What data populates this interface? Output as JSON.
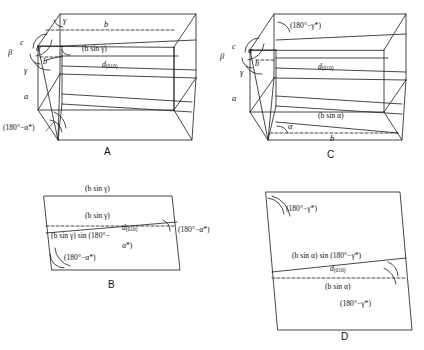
{
  "figure": {
    "background": "#ffffff",
    "line_color": "#1a1a1a",
    "panels": [
      {
        "id": "A",
        "letter": "A",
        "type": "oblique-cell-3d",
        "labels": [
          {
            "text": "γ",
            "kind": "greek-italic"
          },
          {
            "text": "c",
            "kind": "axis-italic"
          },
          {
            "text": "β",
            "kind": "greek-italic"
          },
          {
            "text": "α",
            "kind": "greek-italic"
          },
          {
            "text": "b",
            "kind": "axis-italic"
          },
          {
            "text": "γ",
            "kind": "greek-italic"
          },
          {
            "text": "a",
            "kind": "axis-italic"
          },
          {
            "text": "b",
            "kind": "edge-italic"
          },
          {
            "text": "(b sin γ)",
            "kind": "expression"
          },
          {
            "text": "d(010)",
            "kind": "d-spacing"
          },
          {
            "text": "(180°−α*)",
            "kind": "angle-expression"
          }
        ]
      },
      {
        "id": "C",
        "letter": "C",
        "type": "oblique-cell-3d",
        "labels": [
          {
            "text": "(180°−γ*)",
            "kind": "angle-expression"
          },
          {
            "text": "c",
            "kind": "axis-italic"
          },
          {
            "text": "β",
            "kind": "greek-italic"
          },
          {
            "text": "α",
            "kind": "greek-italic"
          },
          {
            "text": "b",
            "kind": "axis-italic"
          },
          {
            "text": "γ",
            "kind": "greek-italic"
          },
          {
            "text": "a",
            "kind": "axis-italic"
          },
          {
            "text": "d(010)",
            "kind": "d-spacing"
          },
          {
            "text": "(b sin α)",
            "kind": "expression"
          },
          {
            "text": "α",
            "kind": "greek-italic"
          },
          {
            "text": "b",
            "kind": "edge-italic"
          }
        ]
      },
      {
        "id": "B",
        "letter": "B",
        "type": "parallelogram-2d",
        "labels": [
          {
            "text": "(b sin γ)",
            "kind": "expression"
          },
          {
            "text": "(b sin γ)",
            "kind": "expression"
          },
          {
            "text": "(b sin γ) sin (180°−α*)",
            "kind": "expression"
          },
          {
            "text": "d(010)",
            "kind": "d-spacing"
          },
          {
            "text": "(180°−α*)",
            "kind": "angle-expression"
          },
          {
            "text": "(180°−α*)",
            "kind": "angle-expression"
          }
        ]
      },
      {
        "id": "D",
        "letter": "D",
        "type": "parallelogram-2d",
        "labels": [
          {
            "text": "(180°−γ*)",
            "kind": "angle-expression"
          },
          {
            "text": "(b sin α) sin (180°−γ*)",
            "kind": "expression"
          },
          {
            "text": "d(010)",
            "kind": "d-spacing"
          },
          {
            "text": "(b sin α)",
            "kind": "expression"
          },
          {
            "text": "(180°−γ*)",
            "kind": "angle-expression"
          }
        ]
      }
    ]
  },
  "text": {
    "gamma": "γ",
    "beta": "β",
    "alpha": "α",
    "a": "a",
    "b": "b",
    "c": "c",
    "b_sin_gamma": "(b sin γ)",
    "b_sin_alpha": "(b sin α)",
    "d_symbol": "d",
    "d_subscript": "(010)",
    "ang_180_alpha": "(180°−α*)",
    "ang_180_gamma": "(180°−γ*)",
    "b_sin_gamma_sin_1": "(b sin γ) sin (180°−",
    "b_sin_gamma_sin_2": "α*)",
    "b_sin_alpha_sin": "(b sin α) sin (180°−γ*)",
    "letter_A": "A",
    "letter_B": "B",
    "letter_C": "C",
    "letter_D": "D"
  }
}
